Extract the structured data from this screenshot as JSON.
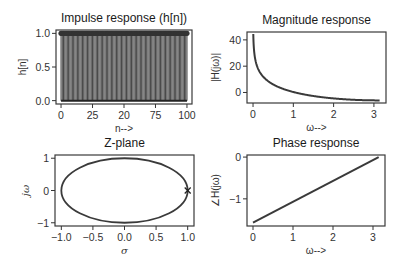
{
  "chart_data": [
    {
      "type": "bar",
      "subtype": "stem",
      "title": "Impulse response (h[n])",
      "xlabel": "n-->",
      "ylabel": "h[n]",
      "xticks": [
        "0",
        "25",
        "20",
        "75",
        "100"
      ],
      "xtick_values": [
        0,
        25,
        50,
        75,
        100
      ],
      "yticks": [
        "0.0",
        "0.5",
        "1.0"
      ],
      "xlim": [
        -4,
        104
      ],
      "ylim": [
        -0.05,
        1.05
      ],
      "x_range": [
        0,
        100
      ],
      "values_description": "h[n] = 1 for n = 0..100",
      "value": 1.0,
      "count": 101,
      "color": "#3a3a3a"
    },
    {
      "type": "line",
      "title": "Magnitude response",
      "xlabel": "ω-->",
      "ylabel": "|H(jω)|",
      "xticks": [
        "0",
        "1",
        "2",
        "3"
      ],
      "yticks": [
        "0",
        "20",
        "40"
      ],
      "xlim": [
        -0.15,
        3.3
      ],
      "ylim": [
        -8,
        46
      ],
      "x": [
        0.006,
        0.05,
        0.1,
        0.2,
        0.3,
        0.5,
        0.75,
        1.0,
        1.5,
        2.0,
        2.5,
        3.1416
      ],
      "y": [
        44.3,
        26.0,
        20.0,
        14.0,
        10.5,
        6.1,
        2.7,
        0.4,
        -2.8,
        -4.7,
        -5.7,
        -6.0
      ],
      "color": "#3a3a3a"
    },
    {
      "type": "scatter",
      "subtype": "z-plane",
      "title": "Z-plane",
      "xlabel": "σ",
      "ylabel": "jω",
      "xticks": [
        "−1.0",
        "−0.5",
        "0.0",
        "0.5",
        "1.0"
      ],
      "yticks": [
        "−1",
        "0",
        "1"
      ],
      "xlim": [
        -1.1,
        1.1
      ],
      "ylim": [
        -1.1,
        1.1
      ],
      "unit_circle": true,
      "poles": [
        {
          "x": 1.0,
          "y": 0.0,
          "marker": "x"
        }
      ],
      "color": "#3a3a3a"
    },
    {
      "type": "line",
      "title": "Phase response",
      "xlabel": "ω-->",
      "ylabel": "∠H(jω)",
      "xticks": [
        "0",
        "1",
        "2",
        "3"
      ],
      "yticks": [
        "−1",
        "0"
      ],
      "xlim": [
        -0.15,
        3.3
      ],
      "ylim": [
        -1.65,
        0.05
      ],
      "x": [
        0,
        3.1416
      ],
      "y": [
        -1.5708,
        0
      ],
      "color": "#3a3a3a"
    }
  ]
}
